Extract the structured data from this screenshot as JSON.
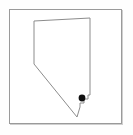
{
  "map": {
    "title": "Nevada",
    "region_name": "Nevada",
    "type": "state-outline-thumbnail",
    "background_color": "#ffffff",
    "frame": {
      "border_color": "#9a9a9a",
      "shadow_color": "#787878",
      "x": 9,
      "y": 9,
      "width": 113,
      "height": 115
    },
    "outline": {
      "stroke_color": "#8c8c8c",
      "stroke_width": 1,
      "fill": "none",
      "points": "34,21 90,18 90,95 88,95 88,99 84,99 84,103 80,103 80,107 77,117 34,64 34,21"
    },
    "marker": {
      "label": "",
      "shape": "circle",
      "color": "#101010",
      "radius": 3.4,
      "cx": 82,
      "cy": 98
    }
  }
}
